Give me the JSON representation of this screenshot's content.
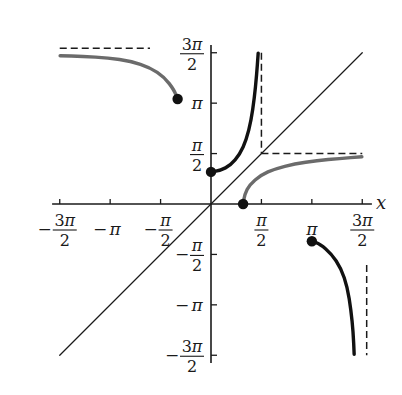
{
  "chart_data": {
    "type": "line",
    "title": "",
    "xlabel": "x",
    "ylabel": "",
    "xlim": [
      -4.712,
      4.712
    ],
    "ylim": [
      -4.712,
      4.712
    ],
    "grid": false,
    "legend": "none",
    "x_ticks": [
      {
        "value": -4.712,
        "label": "-3π/2",
        "sign": "−",
        "num": "3π",
        "den": "2"
      },
      {
        "value": -3.1416,
        "label": "-π",
        "sign": "−",
        "num": "π",
        "den": ""
      },
      {
        "value": -1.5708,
        "label": "-π/2",
        "sign": "−",
        "num": "π",
        "den": "2"
      },
      {
        "value": 1.5708,
        "label": "π/2",
        "sign": "",
        "num": "π",
        "den": "2"
      },
      {
        "value": 3.1416,
        "label": "π",
        "sign": "",
        "num": "π",
        "den": ""
      },
      {
        "value": 4.712,
        "label": "3π/2",
        "sign": "",
        "num": "3π",
        "den": "2"
      }
    ],
    "y_ticks": [
      {
        "value": 4.712,
        "label": "3π/2",
        "sign": "",
        "num": "3π",
        "den": "2"
      },
      {
        "value": 3.1416,
        "label": "π",
        "sign": "",
        "num": "π",
        "den": ""
      },
      {
        "value": 1.5708,
        "label": "π/2",
        "sign": "",
        "num": "π",
        "den": "2"
      },
      {
        "value": -1.5708,
        "label": "-π/2",
        "sign": "−",
        "num": "π",
        "den": "2"
      },
      {
        "value": -3.1416,
        "label": "-π",
        "sign": "−",
        "num": "π",
        "den": ""
      },
      {
        "value": -4.712,
        "label": "-3π/2",
        "sign": "−",
        "num": "3π",
        "den": "2"
      }
    ],
    "series": [
      {
        "name": "identity line y = x",
        "style": "thin solid",
        "color": "#1a1a1a",
        "x": [
          -4.712,
          4.712
        ],
        "y": [
          -4.712,
          4.712
        ]
      },
      {
        "name": "black branch near origin (rising)",
        "style": "thick solid",
        "color": "#111111",
        "start_dot": [
          0,
          1.0
        ],
        "x": [
          0,
          0.3,
          0.6,
          0.9,
          1.1,
          1.25,
          1.35,
          1.42,
          1.47
        ],
        "y": [
          1.0,
          1.05,
          1.2,
          1.55,
          2.0,
          2.6,
          3.3,
          4.0,
          4.7
        ]
      },
      {
        "name": "gray branch reflection (toward y = π/2)",
        "style": "thick solid",
        "color": "#6b6b6b",
        "start_dot": [
          1.0,
          0
        ],
        "x": [
          1.0,
          1.05,
          1.2,
          1.55,
          2.0,
          2.6,
          3.3,
          4.0,
          4.7
        ],
        "y": [
          0,
          0.3,
          0.6,
          0.9,
          1.1,
          1.25,
          1.35,
          1.42,
          1.47
        ]
      },
      {
        "name": "gray upper-left branch (toward y = 3π/2)",
        "style": "thick solid",
        "color": "#6b6b6b",
        "end_dot": [
          -1.04,
          3.27
        ],
        "x": [
          -4.7,
          -4.0,
          -3.2,
          -2.5,
          -1.9,
          -1.45,
          -1.15,
          -1.04
        ],
        "y": [
          4.62,
          4.6,
          4.55,
          4.45,
          4.25,
          3.95,
          3.55,
          3.27
        ]
      },
      {
        "name": "black lower-right branch (toward x = 3π/2)",
        "style": "thick solid",
        "color": "#111111",
        "start_dot": [
          3.1416,
          -1.16
        ],
        "x": [
          3.1416,
          3.4,
          3.75,
          4.05,
          4.25,
          4.36,
          4.43,
          4.46
        ],
        "y": [
          -1.16,
          -1.25,
          -1.55,
          -2.0,
          -2.6,
          -3.3,
          -4.0,
          -4.68
        ]
      }
    ],
    "asymptotes": [
      {
        "type": "vertical",
        "x": 1.5708,
        "y_range": [
          1.5708,
          4.712
        ],
        "style": "dashed"
      },
      {
        "type": "horizontal",
        "y": 1.5708,
        "x_range": [
          1.5708,
          4.712
        ],
        "style": "dashed"
      },
      {
        "type": "horizontal",
        "y": 4.85,
        "x_range": [
          -4.712,
          -1.9
        ],
        "style": "dashed"
      },
      {
        "type": "vertical",
        "x": 4.85,
        "y_range": [
          -4.712,
          -1.9
        ],
        "style": "dashed"
      }
    ],
    "annotations": [
      "x"
    ]
  },
  "axes": {
    "x_label": "x"
  }
}
